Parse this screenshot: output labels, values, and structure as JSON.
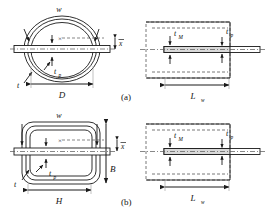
{
  "figure": {
    "background": "#ffffff",
    "line_color": "#1a1a1a",
    "dash_color": "#555555",
    "fill_color": "#f2f2f2"
  },
  "panels": [
    {
      "id": "a",
      "label": "(a)",
      "shape": "circular",
      "views": {
        "front": {
          "labels": {
            "width": "w",
            "thickness": "t",
            "plate_thickness": "t",
            "plate_thickness_sub": "p",
            "diameter": "D",
            "offset": "x",
            "offset_overbar": true,
            "centroid_marker": "×"
          }
        },
        "side": {
          "labels": {
            "magnet_thickness": "t",
            "magnet_thickness_sub": "M",
            "plate_thickness": "t",
            "plate_thickness_sub": "p",
            "winding_length": "L",
            "winding_length_sub": "w"
          }
        }
      }
    },
    {
      "id": "b",
      "label": "(b)",
      "shape": "rectangular",
      "views": {
        "front": {
          "labels": {
            "width": "w",
            "thickness": "t",
            "plate_thickness": "t",
            "plate_thickness_sub": "p",
            "height": "B",
            "base": "H",
            "offset": "x",
            "offset_overbar": true,
            "centroid_marker": "×"
          }
        },
        "side": {
          "labels": {
            "magnet_thickness": "t",
            "magnet_thickness_sub": "M",
            "plate_thickness": "t",
            "plate_thickness_sub": "p",
            "winding_length": "L",
            "winding_length_sub": "w"
          }
        }
      }
    }
  ]
}
